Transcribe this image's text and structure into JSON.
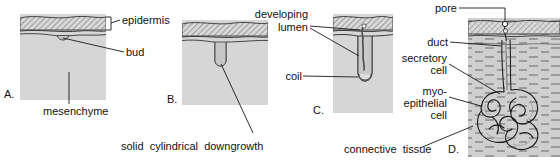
{
  "figure": {
    "type": "four-stage histological schematic",
    "background": "#ffffff",
    "ink": "#1a1a1a",
    "epidermis_fill": "#bfbfbf",
    "mesenchyme_fill": "#d4d4d4",
    "dermis_fill": "#cccccc",
    "lumen_fill": "#e8e8e8"
  },
  "panels": [
    {
      "letter": "A.",
      "stage": "epidermal bud",
      "labels": [
        "epidermis",
        "bud",
        "mesenchyme"
      ]
    },
    {
      "letter": "B.",
      "stage": "solid cylindrical downgrowth",
      "labels": [
        "solid cylindrical downgrowth"
      ]
    },
    {
      "letter": "C.",
      "stage": "canalisation and coiling",
      "labels": [
        "developing lumen",
        "coil"
      ]
    },
    {
      "letter": "D.",
      "stage": "mature gland",
      "labels": [
        "pore",
        "duct",
        "secretory cell",
        "myo-epithelial cell",
        "connective tissue"
      ]
    }
  ],
  "labels": {
    "epidermis": "epidermis",
    "bud": "bud",
    "mesenchyme": "mesenchyme",
    "downgrowth": "solid  cylindrical  downgrowth",
    "developing": "developing",
    "lumen": "lumen",
    "coil": "coil",
    "pore": "pore",
    "duct": "duct",
    "secretory": "secretory",
    "cell1": "cell",
    "myo": "myo-",
    "epithelial": "epithelial",
    "cell2": "cell",
    "connective": "connective  tissue",
    "letter_a": "A.",
    "letter_b": "B.",
    "letter_c": "C.",
    "letter_d": "D."
  }
}
